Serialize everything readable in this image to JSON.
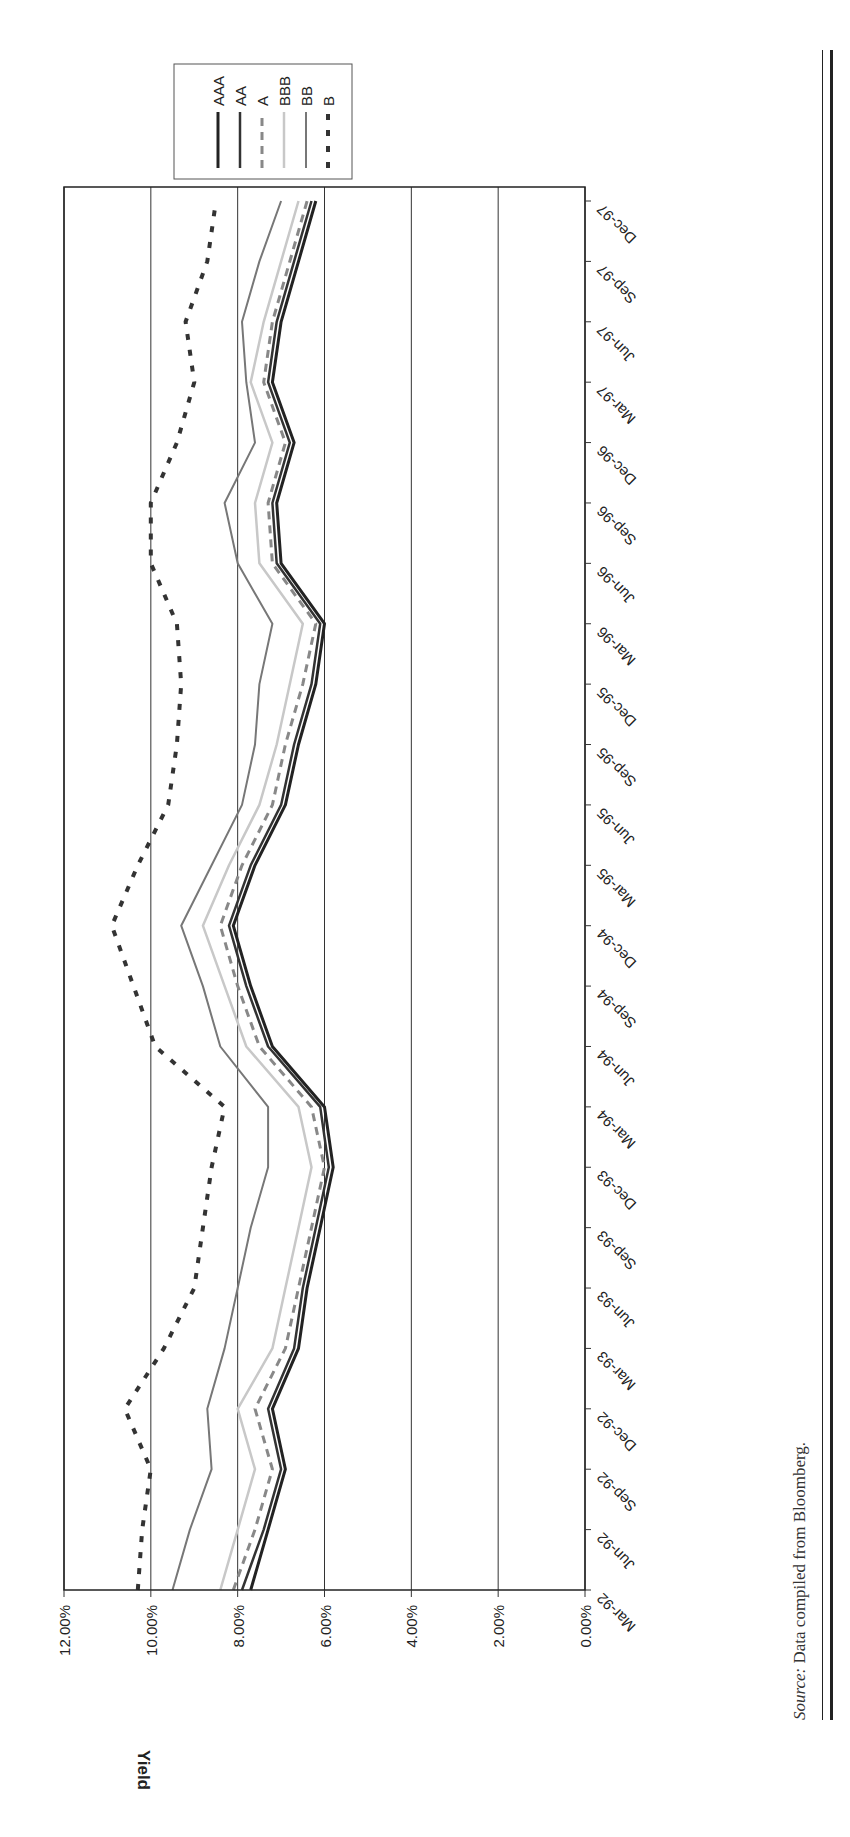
{
  "chart_data": {
    "type": "line",
    "title": "",
    "orientation_note": "figure printed rotated 90 degrees clockwise",
    "xlabel": "",
    "ylabel": "Yield",
    "ylim": [
      0,
      12
    ],
    "yticks": [
      "0.00%",
      "2.00%",
      "4.00%",
      "6.00%",
      "8.00%",
      "10.00%",
      "12.00%"
    ],
    "grid": true,
    "legend_position": "top-right (rotated)",
    "categories": [
      "Mar-92",
      "Jun-92",
      "Sep-92",
      "Dec-92",
      "Mar-93",
      "Jun-93",
      "Sep-93",
      "Dec-93",
      "Mar-94",
      "Jun-94",
      "Sep-94",
      "Dec-94",
      "Mar-95",
      "Jun-95",
      "Sep-95",
      "Dec-95",
      "Mar-96",
      "Jun-96",
      "Sep-96",
      "Dec-96",
      "Mar-97",
      "Jun-97",
      "Sep-97",
      "Dec-97"
    ],
    "series": [
      {
        "name": "AAA",
        "style": "solid",
        "color": "#222222",
        "width": 3,
        "values": [
          7.7,
          7.3,
          6.9,
          7.2,
          6.6,
          6.4,
          6.1,
          5.8,
          6.0,
          7.2,
          7.7,
          8.1,
          7.6,
          6.9,
          6.6,
          6.2,
          6.0,
          7.0,
          7.1,
          6.7,
          7.2,
          7.0,
          6.6,
          6.2
        ]
      },
      {
        "name": "AA",
        "style": "solid",
        "color": "#333333",
        "width": 2.5,
        "values": [
          7.9,
          7.4,
          7.0,
          7.3,
          6.7,
          6.5,
          6.2,
          5.9,
          6.1,
          7.3,
          7.8,
          8.2,
          7.7,
          7.0,
          6.7,
          6.3,
          6.1,
          7.1,
          7.2,
          6.8,
          7.3,
          7.1,
          6.7,
          6.3
        ]
      },
      {
        "name": "A",
        "style": "dashed",
        "color": "#888888",
        "width": 3,
        "values": [
          8.1,
          7.6,
          7.2,
          7.6,
          6.9,
          6.6,
          6.3,
          6.0,
          6.3,
          7.5,
          8.0,
          8.4,
          7.9,
          7.2,
          6.9,
          6.5,
          6.2,
          7.2,
          7.3,
          6.9,
          7.4,
          7.2,
          6.8,
          6.4
        ]
      },
      {
        "name": "BBB",
        "style": "solid",
        "color": "#c8c8c8",
        "width": 2.5,
        "values": [
          8.4,
          8.0,
          7.6,
          8.0,
          7.2,
          6.9,
          6.6,
          6.3,
          6.6,
          7.8,
          8.3,
          8.8,
          8.2,
          7.5,
          7.1,
          6.8,
          6.5,
          7.5,
          7.6,
          7.2,
          7.7,
          7.4,
          7.0,
          6.6
        ]
      },
      {
        "name": "BB",
        "style": "solid",
        "color": "#777777",
        "width": 2,
        "values": [
          9.5,
          9.1,
          8.6,
          8.7,
          8.3,
          8.0,
          7.7,
          7.3,
          7.3,
          8.4,
          8.8,
          9.3,
          8.6,
          7.9,
          7.6,
          7.5,
          7.2,
          8.0,
          8.3,
          7.6,
          7.8,
          7.9,
          7.5,
          7.0
        ]
      },
      {
        "name": "B",
        "style": "dotted",
        "color": "#333333",
        "width": 4,
        "values": [
          10.3,
          10.2,
          10.0,
          10.6,
          9.7,
          9.0,
          8.8,
          8.6,
          8.3,
          9.9,
          10.4,
          10.9,
          10.3,
          9.6,
          9.4,
          9.3,
          9.4,
          10.0,
          10.0,
          9.4,
          9.0,
          9.2,
          8.7,
          8.5
        ]
      }
    ]
  },
  "axes": {
    "y_title": "Yield",
    "y_ticks": [
      "12.00%",
      "10.00%",
      "8.00%",
      "6.00%",
      "4.00%",
      "2.00%",
      "0.00%"
    ],
    "x_ticks": [
      "Mar-92",
      "Jun-92",
      "Sep-92",
      "Dec-92",
      "Mar-93",
      "Jun-93",
      "Sep-93",
      "Dec-93",
      "Mar-94",
      "Jun-94",
      "Sep-94",
      "Dec-94",
      "Mar-95",
      "Jun-95",
      "Sep-95",
      "Dec-95",
      "Mar-96",
      "Jun-96",
      "Sep-96",
      "Dec-96",
      "Mar-97",
      "Jun-97",
      "Sep-97",
      "Dec-97"
    ]
  },
  "legend": {
    "items": [
      {
        "label": "AAA"
      },
      {
        "label": "AA"
      },
      {
        "label": "A"
      },
      {
        "label": "BBB"
      },
      {
        "label": "BB"
      },
      {
        "label": "B"
      }
    ]
  },
  "source": {
    "label": "Source:",
    "text": "Data compiled from Bloomberg."
  }
}
